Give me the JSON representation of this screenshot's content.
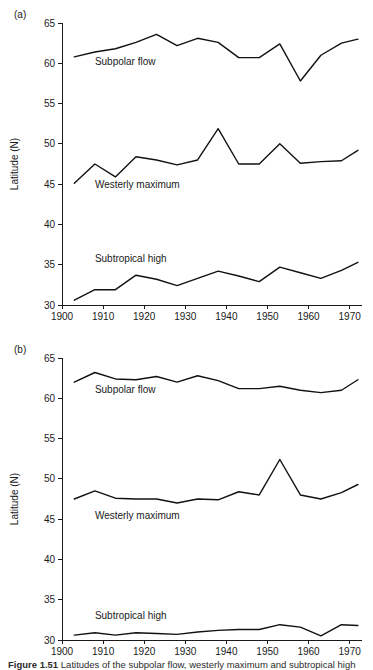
{
  "figure": {
    "caption_prefix": "Figure 1.51",
    "caption_rest": " Latitudes of the subpolar flow, westerly maximum and subtropical high"
  },
  "panels": [
    {
      "tag": "(a)",
      "name": "panel-a",
      "chart_data": {
        "type": "line",
        "title": "",
        "xlabel": "",
        "ylabel": "Latitude (N)",
        "xlim": [
          1900,
          1973
        ],
        "ylim": [
          30,
          65
        ],
        "xticks": [
          1900,
          1910,
          1920,
          1930,
          1940,
          1950,
          1960,
          1970
        ],
        "yticks": [
          30,
          35,
          40,
          45,
          50,
          55,
          60,
          65
        ],
        "grid": false,
        "legend": "inline-labels",
        "x": [
          1903,
          1908,
          1913,
          1918,
          1923,
          1928,
          1933,
          1938,
          1943,
          1948,
          1953,
          1958,
          1963,
          1968,
          1972
        ],
        "series": [
          {
            "name": "Subpolar flow",
            "label": "Subpolar flow",
            "label_x": 1908,
            "label_y": 59.8,
            "values": [
              60.8,
              61.4,
              61.8,
              62.6,
              63.6,
              62.2,
              63.1,
              62.6,
              60.7,
              60.7,
              62.4,
              57.8,
              61.0,
              62.5,
              63.0
            ]
          },
          {
            "name": "Westerly maximum",
            "label": "Westerly maximum",
            "label_x": 1908,
            "label_y": 44.5,
            "values": [
              45.1,
              47.5,
              45.9,
              48.4,
              48.0,
              47.4,
              48.0,
              51.9,
              47.5,
              47.5,
              50.0,
              47.6,
              47.8,
              47.9,
              49.2
            ]
          },
          {
            "name": "Subtropical high",
            "label": "Subtropical high",
            "label_x": 1908,
            "label_y": 35.3,
            "values": [
              30.6,
              31.9,
              31.9,
              33.7,
              33.2,
              32.4,
              33.3,
              34.2,
              33.6,
              32.9,
              34.7,
              34.0,
              33.3,
              34.3,
              35.3
            ]
          }
        ]
      }
    },
    {
      "tag": "(b)",
      "name": "panel-b",
      "chart_data": {
        "type": "line",
        "title": "",
        "xlabel": "",
        "ylabel": "Latitude (N)",
        "xlim": [
          1900,
          1973
        ],
        "ylim": [
          30,
          65
        ],
        "xticks": [
          1900,
          1910,
          1920,
          1930,
          1940,
          1950,
          1960,
          1970
        ],
        "yticks": [
          30,
          35,
          40,
          45,
          50,
          55,
          60,
          65
        ],
        "grid": false,
        "legend": "inline-labels",
        "x": [
          1903,
          1908,
          1913,
          1918,
          1923,
          1928,
          1933,
          1938,
          1943,
          1948,
          1953,
          1958,
          1963,
          1968,
          1972
        ],
        "series": [
          {
            "name": "Subpolar flow",
            "label": "Subpolar flow",
            "label_x": 1908,
            "label_y": 60.6,
            "values": [
              62.0,
              63.2,
              62.4,
              62.3,
              62.7,
              62.0,
              62.8,
              62.2,
              61.2,
              61.2,
              61.5,
              61.0,
              60.7,
              61.0,
              62.3
            ]
          },
          {
            "name": "Westerly maximum",
            "label": "Westerly maximum",
            "label_x": 1908,
            "label_y": 45.0,
            "values": [
              47.5,
              48.5,
              47.6,
              47.5,
              47.5,
              47.0,
              47.5,
              47.4,
              48.4,
              48.0,
              52.4,
              48.0,
              47.5,
              48.3,
              49.3
            ]
          },
          {
            "name": "Subtropical high",
            "label": "Subtropical high",
            "label_x": 1908,
            "label_y": 32.6,
            "values": [
              30.6,
              30.9,
              30.6,
              30.9,
              30.8,
              30.7,
              31.0,
              31.2,
              31.3,
              31.3,
              31.9,
              31.6,
              30.5,
              31.9,
              31.8
            ]
          }
        ]
      }
    }
  ]
}
